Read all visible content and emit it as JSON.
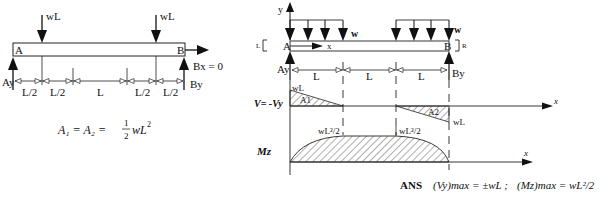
{
  "left_figure": {
    "loads": [
      {
        "label": "wL"
      },
      {
        "label": "wL"
      }
    ],
    "support_a": {
      "point": "A",
      "reaction": "Ay"
    },
    "support_b": {
      "point": "B",
      "reaction_y": "By",
      "reaction_x": "Bx = 0"
    },
    "dimensions": [
      "L/2",
      "L/2",
      "L",
      "L/2",
      "L/2"
    ],
    "equation": {
      "lhs": "A₁ = A₂ =",
      "frac_num": "1",
      "frac_den": "2",
      "rhs": "wL",
      "exp": "2"
    }
  },
  "right_figure": {
    "axis_y": "y",
    "axis_x": "x",
    "dist_load_label_1": "w",
    "dist_load_label_2": "w",
    "point_a": "A",
    "point_b": "B",
    "cut_left": "L",
    "cut_right": "R",
    "reaction_a": "Ay",
    "reaction_b": "By",
    "dimensions": [
      "L",
      "L",
      "L"
    ],
    "shear": {
      "label": "V= -Vy",
      "peak_left": "wL",
      "area_1": "A1",
      "area_2": "A2",
      "peak_right": "wL",
      "axis": "x"
    },
    "moment": {
      "label": "Mz",
      "value_1": "wL²/2",
      "value_2": "wL²/2",
      "axis": "x"
    }
  },
  "answer": {
    "prefix": "ANS",
    "vy_term": "(Vy)max = ±wL ;",
    "mz_term": "(Mz)max = wL²/2"
  }
}
